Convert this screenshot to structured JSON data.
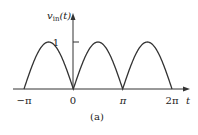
{
  "figure": {
    "caption": "(a)",
    "y_axis_label_main": "v",
    "y_axis_label_sub": "in",
    "y_axis_label_arg": "(t)",
    "x_axis_label": "t",
    "y_tick_label": "1",
    "x_tick_labels": [
      "−π",
      "0",
      "π",
      "2π"
    ],
    "colors": {
      "stroke": "#333333",
      "text": "#222222"
    }
  },
  "chart_data": {
    "type": "line",
    "title": "",
    "xlabel": "t",
    "ylabel": "v_in(t)",
    "x_ticks": [
      "−π",
      "0",
      "π",
      "2π"
    ],
    "x_tick_values": [
      -3.1416,
      0,
      3.1416,
      6.2832
    ],
    "y_ticks": [
      "1"
    ],
    "y_tick_values": [
      1
    ],
    "xlim": [
      -3.6,
      7.2
    ],
    "ylim": [
      0,
      1.45
    ],
    "grid": false,
    "series": [
      {
        "name": "v_in(t)",
        "x": [
          -3.1416,
          -2.3562,
          -1.5708,
          -0.7854,
          0,
          0.7854,
          1.5708,
          2.3562,
          3.1416,
          3.927,
          4.7124,
          5.4978,
          6.2832
        ],
        "y": [
          0,
          0.707,
          1,
          0.707,
          0,
          0.707,
          1,
          0.707,
          0,
          0.707,
          1,
          0.707,
          0
        ]
      }
    ]
  }
}
